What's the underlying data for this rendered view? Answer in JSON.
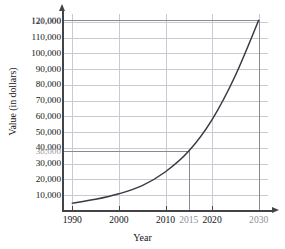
{
  "chart_data": {
    "type": "line",
    "title": "",
    "xlabel": "Year",
    "ylabel": "Value (in dollars)",
    "xlim": [
      1988,
      2032
    ],
    "ylim": [
      0,
      125000
    ],
    "grid": true,
    "legend": "none",
    "x": [
      1990,
      1995,
      2000,
      2005,
      2010,
      2015,
      2020,
      2025,
      2030
    ],
    "values": [
      5000,
      7400,
      10900,
      16100,
      24900,
      38000,
      58000,
      86000,
      121000
    ],
    "series": [
      {
        "name": "Value",
        "values": [
          5000,
          7400,
          10900,
          16100,
          24900,
          38000,
          58000,
          86000,
          121000
        ]
      }
    ],
    "xticklabels": [
      "1990",
      "2000",
      "2010",
      "2015",
      "2020",
      "2030"
    ],
    "xtickvalues": [
      1990,
      2000,
      2010,
      2015,
      2020,
      2030
    ],
    "yticklabels": [
      "10,000",
      "20,000",
      "30,000",
      "40,000",
      "50,000",
      "60,000",
      "70,000",
      "80,000",
      "90,000",
      "100,000",
      "110,000",
      "120,000"
    ],
    "ytickvalues": [
      10000,
      20000,
      30000,
      40000,
      50000,
      60000,
      70000,
      80000,
      90000,
      100000,
      110000,
      120000
    ],
    "annotations": [
      {
        "label": "121,000",
        "value": 121000,
        "year": 2030,
        "style": "gray-guide-lines"
      },
      {
        "label": "38,000",
        "value": 38000,
        "year": 2015,
        "style": "gray-guide-lines"
      }
    ]
  },
  "axes": {
    "y": {
      "title": "Value (in dollars)",
      "ticks": [
        {
          "label": "121,000",
          "value": 121000,
          "annotation": true
        },
        {
          "label": "120,000",
          "value": 120000,
          "annotation": false
        },
        {
          "label": "110,000",
          "value": 110000,
          "annotation": false
        },
        {
          "label": "100,000",
          "value": 100000,
          "annotation": false
        },
        {
          "label": "90,000",
          "value": 90000,
          "annotation": false
        },
        {
          "label": "80,000",
          "value": 80000,
          "annotation": false
        },
        {
          "label": "70,000",
          "value": 70000,
          "annotation": false
        },
        {
          "label": "60,000",
          "value": 60000,
          "annotation": false
        },
        {
          "label": "50,000",
          "value": 50000,
          "annotation": false
        },
        {
          "label": "40,000",
          "value": 40000,
          "annotation": false
        },
        {
          "label": "38,000",
          "value": 38000,
          "annotation": true
        },
        {
          "label": "30,000",
          "value": 30000,
          "annotation": false
        },
        {
          "label": "20,000",
          "value": 20000,
          "annotation": false
        },
        {
          "label": "10,000",
          "value": 10000,
          "annotation": false
        }
      ]
    },
    "x": {
      "title": "Year",
      "ticks": [
        {
          "label": "1990",
          "value": 1990,
          "annotation": false
        },
        {
          "label": "2000",
          "value": 2000,
          "annotation": false
        },
        {
          "label": "2010",
          "value": 2010,
          "annotation": false
        },
        {
          "label": "2015",
          "value": 2015,
          "annotation": true
        },
        {
          "label": "2020",
          "value": 2020,
          "annotation": false
        },
        {
          "label": "2030",
          "value": 2030,
          "annotation": true
        }
      ]
    }
  },
  "colors": {
    "curve": "#3a3a40",
    "axis": "#444448",
    "grid": "#c9c9d2",
    "annotation_line": "#8a8a93",
    "annotation_text": "#9a9aa2",
    "text": "#141418",
    "background": "#ffffff"
  }
}
